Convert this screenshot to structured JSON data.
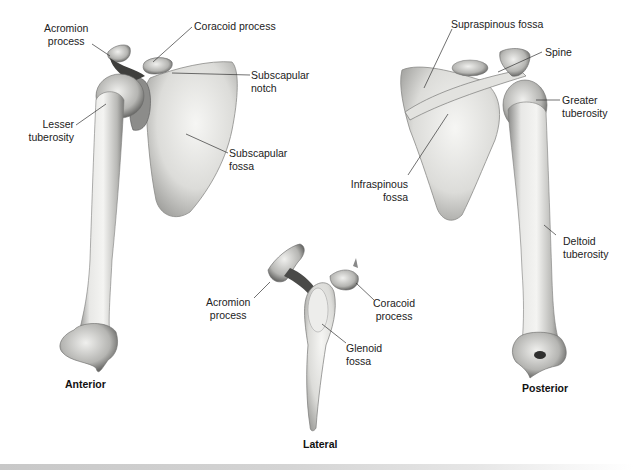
{
  "figure": {
    "views": [
      {
        "name": "Anterior",
        "labels": [
          {
            "line1": "Acromion",
            "line2": "process"
          },
          {
            "line1": "Coracoid process"
          },
          {
            "line1": "Subscapular",
            "line2": "notch"
          },
          {
            "line1": "Lesser",
            "line2": "tuberosity"
          },
          {
            "line1": "Subscapular",
            "line2": "fossa"
          }
        ]
      },
      {
        "name": "Lateral",
        "labels": [
          {
            "line1": "Acromion",
            "line2": "process"
          },
          {
            "line1": "Coracoid",
            "line2": "process"
          },
          {
            "line1": "Glenoid",
            "line2": "fossa"
          }
        ]
      },
      {
        "name": "Posterior",
        "labels": [
          {
            "line1": "Supraspinous fossa"
          },
          {
            "line1": "Spine"
          },
          {
            "line1": "Greater",
            "line2": "tuberosity"
          },
          {
            "line1": "Infraspinous",
            "line2": "fossa"
          },
          {
            "line1": "Deltoid",
            "line2": "tuberosity"
          }
        ]
      }
    ]
  },
  "colors": {
    "bone_light": "#f2f2f0",
    "bone_mid": "#c9c9c6",
    "bone_dark": "#6e6e6c",
    "leader_line": "#333333",
    "label_text": "#222222"
  }
}
